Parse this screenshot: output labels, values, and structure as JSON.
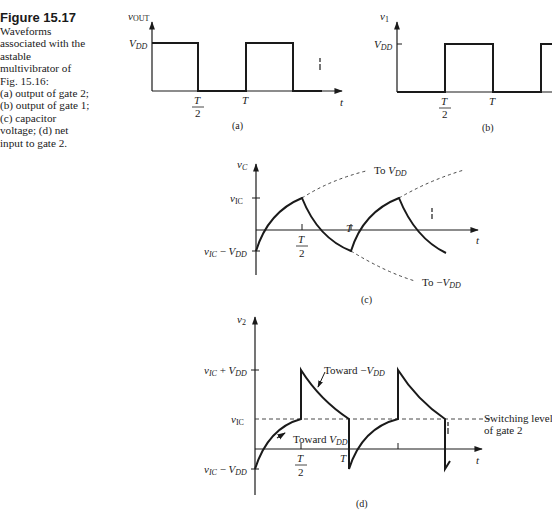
{
  "caption": {
    "title": "Figure 15.17",
    "lines": [
      "Waveforms",
      "associated with the",
      "astable",
      "multivibrator of",
      "Fig. 15.16:",
      "(a) output of gate 2;",
      "(b) output of gate 1;",
      "(c) capacitor",
      "voltage; (d) net",
      "input to gate 2."
    ]
  },
  "panels": {
    "a": {
      "label": "(a)",
      "y_axis": {
        "symbol": "v",
        "subscript": "OUT"
      },
      "x_axis": "t",
      "levels": [
        {
          "symbol": "V",
          "subscript": "DD"
        }
      ],
      "ticks": {
        "half": {
          "num": "T",
          "den": "2"
        },
        "full": "T"
      }
    },
    "b": {
      "label": "(b)",
      "y_axis": {
        "symbol": "v",
        "subscript": "1"
      },
      "levels": [
        {
          "symbol": "V",
          "subscript": "DD"
        }
      ],
      "ticks": {
        "half": {
          "num": "T",
          "den": "2"
        },
        "full": "T"
      }
    },
    "c": {
      "label": "(c)",
      "y_axis": {
        "symbol": "v",
        "subscript": "C"
      },
      "x_axis": "t",
      "levels": {
        "upper": {
          "symbol": "v",
          "subscript": "IC"
        },
        "lower": {
          "a": "v",
          "a_sub": "IC",
          "op": " − ",
          "b": "V",
          "b_sub": "DD"
        }
      },
      "ticks": {
        "half": {
          "num": "T",
          "den": "2"
        },
        "full": "T"
      },
      "annotations": {
        "to_vdd": {
          "prefix": "To ",
          "symbol": "V",
          "subscript": "DD"
        },
        "to_neg_vdd": {
          "prefix": "To −",
          "symbol": "V",
          "subscript": "DD"
        }
      }
    },
    "d": {
      "label": "(d)",
      "y_axis": {
        "symbol": "v",
        "subscript": "2"
      },
      "x_axis": "t",
      "levels": {
        "top": {
          "a": "v",
          "a_sub": "IC",
          "op": " + ",
          "b": "V",
          "b_sub": "DD"
        },
        "mid": {
          "symbol": "v",
          "subscript": "IC"
        },
        "bottom": {
          "a": "v",
          "a_sub": "IC",
          "op": " − ",
          "b": "V",
          "b_sub": "DD"
        }
      },
      "ticks": {
        "half": {
          "num": "T",
          "den": "2"
        },
        "full": "T"
      },
      "annotations": {
        "toward_neg_vdd": {
          "prefix": "Toward −",
          "symbol": "V",
          "subscript": "DD"
        },
        "toward_vdd": {
          "prefix": "Toward ",
          "symbol": "V",
          "subscript": "DD"
        },
        "switching_level_1": "Switching level",
        "switching_level_2": "of gate 2"
      }
    }
  }
}
